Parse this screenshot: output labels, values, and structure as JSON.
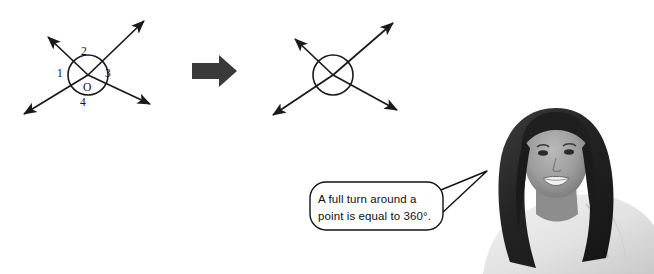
{
  "page": {
    "background_color": "#ffffff",
    "width": 654,
    "height": 274
  },
  "colors": {
    "stroke": "#1a1a1a",
    "transition_arrow": "#3a3a3a",
    "bubble_stroke": "#111111",
    "bubble_fill": "#ffffff",
    "text": "#111111",
    "hair_dark": "#2b2b2b",
    "skin_mid": "#9a9a9a",
    "top_light": "#e9e9e9"
  },
  "diagram_left": {
    "name": "two-intersecting-lines-labelled",
    "center": {
      "x": 88,
      "y": 75
    },
    "circle_radius": 20,
    "center_point_label": "O",
    "angle_labels": [
      {
        "id": "angle-1",
        "text": "1",
        "position": "left"
      },
      {
        "id": "angle-2",
        "text": "2",
        "position": "top"
      },
      {
        "id": "angle-3",
        "text": "3",
        "position": "right"
      },
      {
        "id": "angle-4",
        "text": "4",
        "position": "bottom"
      }
    ],
    "rays": [
      {
        "id": "ray-upper-left",
        "tip_x": 44,
        "tip_y": 33
      },
      {
        "id": "ray-upper-right",
        "tip_x": 148,
        "tip_y": 17
      },
      {
        "id": "ray-lower-left",
        "tip_x": 20,
        "tip_y": 117
      },
      {
        "id": "ray-lower-right",
        "tip_x": 155,
        "tip_y": 107
      }
    ]
  },
  "transition_arrow": {
    "name": "transition-arrow-right",
    "direction": "right",
    "x": 192,
    "y": 60,
    "width": 44,
    "height": 22
  },
  "diagram_right": {
    "name": "two-intersecting-lines-unlabelled",
    "center": {
      "x": 333,
      "y": 75
    },
    "circle_radius": 20,
    "angle_labels": [],
    "rays": [
      {
        "id": "ray-upper-left",
        "tip_x": 291,
        "tip_y": 35
      },
      {
        "id": "ray-upper-right",
        "tip_x": 397,
        "tip_y": 19
      },
      {
        "id": "ray-lower-left",
        "tip_x": 269,
        "tip_y": 118
      },
      {
        "id": "ray-lower-right",
        "tip_x": 402,
        "tip_y": 113
      }
    ]
  },
  "speech_bubble": {
    "name": "speech-bubble",
    "line1": "A full turn around a",
    "line2": "point is equal to 360°.",
    "full_text": "A full turn around a point is equal to 360°.",
    "tail_points_to": "girl-photo"
  },
  "photo": {
    "name": "student-photo",
    "description": "smiling girl with long dark hair wearing a white top",
    "grayscale": true
  }
}
